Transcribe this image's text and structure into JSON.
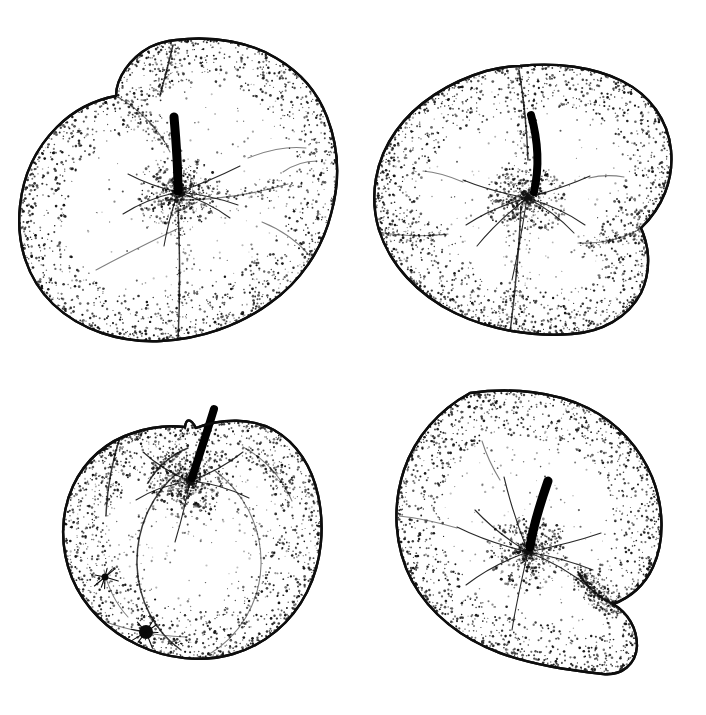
{
  "document": {
    "title": "Apple fruit illustrations",
    "kind": "pen-and-ink stipple botanical plate",
    "medium": "black ink stipple on white",
    "background_color": "#ffffff",
    "ink_color": "#0d0d0d",
    "canvas": {
      "width": 706,
      "height": 715
    },
    "layout": {
      "rows": 2,
      "columns": 2,
      "count": 4
    }
  },
  "figures": [
    {
      "id": "apple-top-left",
      "position": "top-left",
      "label": "Apple, calyx/blossom end view with three lobes",
      "view": "calyx end, ribbed lobes",
      "bbox": {
        "x": 18,
        "y": 38,
        "width": 314,
        "height": 310
      },
      "center": {
        "x": 175,
        "y": 193
      },
      "outline_path": "M 176 40 C 214 35 252 43 276 58 C 300 72 318 93 327 117 C 339 148 340 182 331 214 C 322 250 300 282 270 303 C 239 326 200 339 161 341 C 120 343 80 330 53 304 C 27 279 16 243 20 206 C 23 176 36 148 57 127 C 73 111 94 100 116 96 C 116 78 130 58 150 47 C 158 43 167 41 176 40 Z",
      "lobe_lines": [
        "M 173 45 C 169 62 164 80 160 96",
        "M 165 200 C 204 201 245 197 288 184",
        "M 178 207 C 180 252 180 300 178 341",
        "M 118 97 C 140 110 160 130 170 152"
      ],
      "stem": {
        "path": "M 174 117 C 176 140 178 163 178 191",
        "width": 9
      },
      "calyx_center": {
        "x": 178,
        "y": 192
      },
      "calyx_rays": [
        "M 178 192 C 160 196 140 203 123 214",
        "M 178 192 C 196 186 218 177 240 166",
        "M 178 192 C 196 198 214 206 230 218",
        "M 178 192 C 172 210 167 228 164 246",
        "M 178 192 C 160 188 143 182 128 174",
        "M 178 192 C 198 194 219 198 238 205"
      ],
      "detail_strokes": [
        "M 96 270 C 122 256 150 242 177 229",
        "M 248 158 C 268 150 288 146 306 148",
        "M 262 222 C 282 230 298 242 310 256",
        "M 283 172 C 293 165 305 161 317 161"
      ],
      "stipple": {
        "edge_density": 1450,
        "interior_density": 300,
        "crease_density": 420
      }
    },
    {
      "id": "apple-top-right",
      "position": "top-right",
      "label": "Apple, calyx end view with curved stem",
      "view": "calyx end, two prominent cheeks",
      "bbox": {
        "x": 370,
        "y": 62,
        "width": 302,
        "height": 274
      },
      "center": {
        "x": 521,
        "y": 199
      },
      "outline_path": "M 520 66 C 556 62 594 67 622 81 C 650 95 668 120 671 150 C 674 180 662 208 641 228 C 650 248 651 272 641 293 C 628 318 601 332 572 334 C 532 337 490 330 455 313 C 418 295 390 265 379 230 C 369 197 375 160 396 131 C 416 103 449 82 486 71 C 497 68 509 66 520 66 Z",
      "lobe_lines": [
        "M 519 70 C 524 100 527 130 528 160",
        "M 640 229 C 622 239 600 244 578 243",
        "M 521 206 C 519 250 515 294 510 333",
        "M 378 232 C 400 236 424 237 448 234"
      ],
      "stem": {
        "path": "M 531 115 C 538 140 540 165 534 192",
        "width": 8
      },
      "calyx_center": {
        "x": 527,
        "y": 198
      },
      "calyx_rays": [
        "M 527 198 C 505 194 483 188 463 180",
        "M 527 198 C 548 192 570 185 590 176",
        "M 527 198 C 548 204 568 213 585 225",
        "M 527 198 C 523 225 518 253 512 280",
        "M 527 198 C 505 204 484 213 466 225",
        "M 527 198 C 509 212 492 228 477 246",
        "M 527 198 C 545 207 561 219 574 233"
      ],
      "detail_strokes": [
        "M 463 182 C 449 176 436 172 423 171",
        "M 589 178 C 601 175 613 175 624 177"
      ],
      "stipple": {
        "edge_density": 1500,
        "interior_density": 330,
        "crease_density": 380
      }
    },
    {
      "id": "apple-bottom-left",
      "position": "bottom-left",
      "label": "Apple, side view with upright pointed stem and blossom scar",
      "view": "side view, stem upward",
      "bbox": {
        "x": 62,
        "y": 400,
        "width": 258,
        "height": 262
      },
      "center": {
        "x": 191,
        "y": 530
      },
      "outline_path": "M 196 428 C 222 418 252 418 274 430 C 297 443 312 467 318 495 C 325 527 322 562 307 592 C 292 622 265 645 233 654 C 202 663 167 659 138 645 C 108 631 84 607 72 578 C 60 548 60 514 73 486 C 85 460 107 441 133 433 C 150 427 168 425 185 427 C 186 419 190 417 196 428 Z",
      "lobe_lines": [
        "M 188 448 C 171 455 157 467 148 483",
        "M 243 447 C 265 459 282 478 292 501",
        "M 176 474 C 150 497 136 530 137 565 C 138 600 155 632 181 650",
        "M 214 470 C 244 492 262 527 261 565 C 260 603 239 637 208 655",
        "M 120 437 C 112 462 107 489 106 516"
      ],
      "stem": {
        "path": "M 214 409 C 207 432 199 456 192 478",
        "width": 8
      },
      "calyx_center": {
        "x": 190,
        "y": 481
      },
      "calyx_rays": [
        "M 190 481 C 170 484 152 490 136 500",
        "M 190 481 C 211 483 231 489 249 498",
        "M 190 481 C 186 502 181 522 175 542",
        "M 190 481 C 172 474 156 464 143 452",
        "M 190 481 C 210 474 228 464 243 452"
      ],
      "detail_strokes": [
        "M 104 570 C 108 588 116 604 128 617",
        "M 88 615 C 118 628 152 636 186 637"
      ],
      "blemishes": [
        {
          "cx": 146,
          "cy": 632,
          "r": 7
        },
        {
          "cx": 105,
          "cy": 577,
          "r": 3.5
        }
      ],
      "stipple": {
        "edge_density": 1350,
        "interior_density": 340,
        "crease_density": 400
      }
    },
    {
      "id": "apple-bottom-right",
      "position": "bottom-right",
      "label": "Apple, calyx end view with hooked stem and side notch",
      "view": "calyx end, asymmetric with right-side notch",
      "bbox": {
        "x": 395,
        "y": 390,
        "width": 270,
        "height": 286
      },
      "center": {
        "x": 526,
        "y": 530
      },
      "outline_path": "M 470 393 C 512 387 556 392 588 408 C 618 423 640 448 652 477 C 664 507 665 541 653 567 C 645 585 630 598 613 604 C 628 613 637 628 637 646 C 636 664 622 676 603 674 C 568 670 533 665 500 653 C 462 639 430 614 412 581 C 394 547 392 506 404 470 C 415 437 439 410 470 393 Z",
      "lobe_lines": [
        "M 612 604 C 598 597 586 586 578 572"
      ],
      "stem": {
        "path": "M 548 481 C 540 504 533 527 530 547",
        "width": 9
      },
      "calyx_center": {
        "x": 528,
        "y": 552
      },
      "calyx_rays": [
        "M 528 552 C 503 546 479 538 457 527",
        "M 528 552 C 553 547 578 541 601 533",
        "M 528 552 C 551 561 572 573 590 588",
        "M 528 552 C 522 578 516 604 512 630",
        "M 528 552 C 505 560 484 571 466 585",
        "M 528 552 C 508 540 490 526 475 510",
        "M 528 552 C 551 556 573 562 593 570",
        "M 528 552 C 518 527 510 502 504 477"
      ],
      "detail_strokes": [
        "M 457 528 C 437 522 418 518 399 516",
        "M 500 480 C 492 467 486 454 482 441"
      ],
      "blemishes": [
        {
          "cx": 441,
          "cy": 635,
          "r": 3
        }
      ],
      "stipple": {
        "edge_density": 1550,
        "interior_density": 360,
        "crease_density": 340
      }
    }
  ]
}
